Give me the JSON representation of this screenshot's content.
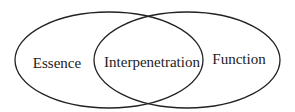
{
  "diagram": {
    "type": "venn",
    "background": "#ffffff",
    "stroke_color": "#222222",
    "text_color": "#222222",
    "sets": [
      {
        "id": "left",
        "label": "Essence",
        "cx": 109,
        "cy": 60,
        "rx": 94,
        "ry": 48,
        "label_x": 57,
        "label_y": 68
      },
      {
        "id": "right",
        "label": "Function",
        "cx": 187,
        "cy": 60,
        "rx": 93,
        "ry": 48,
        "label_x": 239,
        "label_y": 64
      }
    ],
    "intersection": {
      "label": "Interpenetration",
      "label_x": 152,
      "label_y": 67
    }
  }
}
